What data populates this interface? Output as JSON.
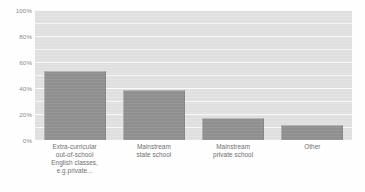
{
  "chart_data": {
    "type": "bar",
    "title": "",
    "subtitle": "",
    "xlabel": "",
    "ylabel": "",
    "ylim": [
      0,
      100
    ],
    "grid": "horizontal",
    "legend": "none",
    "orientation": "vertical",
    "bar_color": "#919191",
    "plot_background": "#e2e2e2",
    "gridline_color": "#f7f7f7",
    "axis_text_color": "#8a8a8a",
    "ytick_labels": [
      "100%",
      "80%",
      "60%",
      "40%",
      "20%",
      "0%"
    ],
    "ytick_values": [
      100,
      80,
      60,
      40,
      20,
      0
    ],
    "minor_gridline_values": [
      90,
      80,
      70,
      60,
      50,
      40,
      30,
      20,
      10
    ],
    "categories": [
      "Extra-curricular out-of-school English classes, e.g.private...",
      "Mainstream state school",
      "Mainstream private school",
      "Other"
    ],
    "category_lines": [
      [
        "Extra-curricular",
        "out-of-school",
        "English classes,",
        "e.g.private..."
      ],
      [
        "Mainstream",
        "state school"
      ],
      [
        "Mainstream",
        "private school"
      ],
      [
        "Other"
      ]
    ],
    "values": [
      52,
      38,
      16,
      11
    ],
    "value_unit": "%"
  }
}
